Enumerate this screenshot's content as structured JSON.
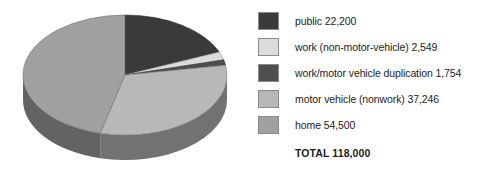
{
  "chart_data": {
    "type": "pie",
    "title": "",
    "total_label": "TOTAL 118,000",
    "total_value": 118000,
    "three_d": true,
    "legend_position": "right",
    "categories": [
      "public",
      "work (non-motor-vehicle)",
      "work/motor vehicle duplication",
      "motor vehicle (nonwork)",
      "home"
    ],
    "values": [
      22200,
      2549,
      1754,
      37246,
      54500
    ],
    "colors": [
      "#3a3a3a",
      "#dcdcdc",
      "#4f4f4f",
      "#b8b8b8",
      "#a0a0a0"
    ],
    "labels": [
      "public 22,200",
      "work (non-motor-vehicle) 2,549",
      "work/motor vehicle duplication 1,754",
      "motor vehicle (nonwork) 37,246",
      "home 54,500"
    ]
  },
  "legend": {
    "items": [
      {
        "label": "public 22,200",
        "color": "#3a3a3a"
      },
      {
        "label": "work (non-motor-vehicle) 2,549",
        "color": "#dcdcdc"
      },
      {
        "label": "work/motor vehicle duplication 1,754",
        "color": "#4f4f4f"
      },
      {
        "label": "motor vehicle (nonwork) 37,246",
        "color": "#b8b8b8"
      },
      {
        "label": "home 54,500",
        "color": "#a0a0a0"
      }
    ],
    "total": "TOTAL 118,000"
  }
}
